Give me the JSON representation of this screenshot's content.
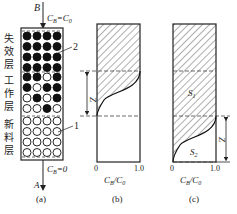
{
  "figure": {
    "panel_a": {
      "caption": "(a)",
      "top_label_B": "B",
      "top_condition": "CB=C0",
      "bottom_label_A": "A",
      "bottom_condition": "CB=0",
      "layers": [
        {
          "name": "失效层",
          "chars": [
            "失",
            "效",
            "层"
          ]
        },
        {
          "name": "工作层",
          "chars": [
            "工",
            "作",
            "层"
          ]
        },
        {
          "name": "新料层",
          "chars": [
            "新",
            "料",
            "层"
          ]
        }
      ],
      "callout_2": "2",
      "callout_1": "1",
      "grid": [
        [
          1,
          1,
          1,
          1
        ],
        [
          1,
          1,
          1,
          1
        ],
        [
          1,
          1,
          1,
          1
        ],
        [
          1,
          1,
          1,
          1
        ],
        [
          1,
          1,
          0,
          1
        ],
        [
          1,
          0,
          1,
          1
        ],
        [
          0,
          1,
          0,
          1
        ],
        [
          0,
          0,
          1,
          0
        ],
        [
          0,
          0,
          0,
          0
        ],
        [
          0,
          0,
          0,
          0
        ],
        [
          0,
          0,
          0,
          0
        ],
        [
          0,
          0,
          0,
          0
        ]
      ]
    },
    "panel_b": {
      "caption": "(b)",
      "z_label": "Z",
      "x_tick_0": "0",
      "x_tick_1": "1.0",
      "x_label": "CB/C0"
    },
    "panel_c": {
      "caption": "(c)",
      "z_label": "Z",
      "s1": "S1",
      "s2": "S2",
      "x_tick_0": "0",
      "x_tick_1": "1.0",
      "x_label": "CB/C0"
    }
  }
}
